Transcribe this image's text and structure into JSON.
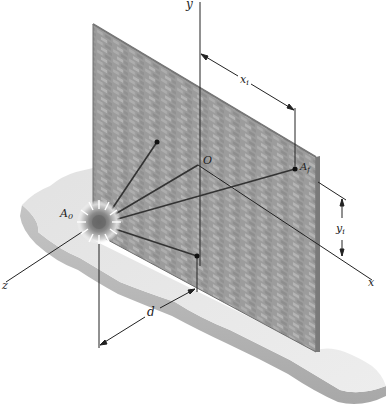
{
  "figure": {
    "type": "3D isometric physics diagram",
    "labels": {
      "y_axis": "y",
      "x_axis": "x",
      "z_axis": "z",
      "origin": "O",
      "source_point": "A",
      "source_sub": "0",
      "target_point": "A",
      "target_sub": "f",
      "dim_x": "x",
      "dim_x_sub": "i",
      "dim_y": "y",
      "dim_y_sub": "i",
      "dim_d": "d"
    },
    "colors": {
      "wall": "#9a9a9a",
      "wall_dark": "#7e7e7e",
      "brick_light": "#b8b8b8",
      "ground_top": "#e6e6e6",
      "ground_side": "#bdbdbd",
      "line": "#222222",
      "burst_core": "#6f6f6f"
    }
  }
}
